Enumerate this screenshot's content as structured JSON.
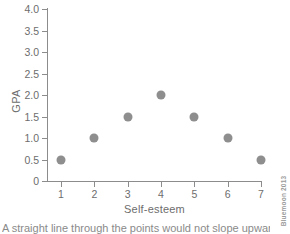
{
  "chart_data": {
    "type": "scatter",
    "title": "",
    "xlabel": "Self-esteem",
    "ylabel": "GPA",
    "x": [
      1,
      2,
      3,
      4,
      5,
      6,
      7
    ],
    "values": [
      0.5,
      1.0,
      1.5,
      2.0,
      1.5,
      1.0,
      0.5
    ],
    "points": [
      {
        "x": 1,
        "y": 0.5
      },
      {
        "x": 2,
        "y": 1.0
      },
      {
        "x": 3,
        "y": 1.5
      },
      {
        "x": 4,
        "y": 2.0
      },
      {
        "x": 5,
        "y": 1.5
      },
      {
        "x": 6,
        "y": 1.0
      },
      {
        "x": 7,
        "y": 0.5
      }
    ],
    "xtick_labels": [
      "1",
      "2",
      "3",
      "4",
      "5",
      "6",
      "7"
    ],
    "ytick_labels": [
      "0",
      "0.5",
      "1.0",
      "1.5",
      "2.0",
      "2.5",
      "3.0",
      "3.5",
      "4.0"
    ],
    "ytick_values": [
      0,
      0.5,
      1.0,
      1.5,
      2.0,
      2.5,
      3.0,
      3.5,
      4.0
    ],
    "xlim": [
      0.6,
      7.4
    ],
    "ylim": [
      0,
      4.0
    ],
    "grid": false,
    "legend": null,
    "marker_color": "#8e8e8e",
    "axis_color": "#8c8c8c",
    "text_color": "#6d6d6d",
    "background": "#ffffff"
  },
  "caption": {
    "text": "A straight line through the points would not slope upward or"
  },
  "credit": {
    "text": "Bluemoon 2013"
  }
}
